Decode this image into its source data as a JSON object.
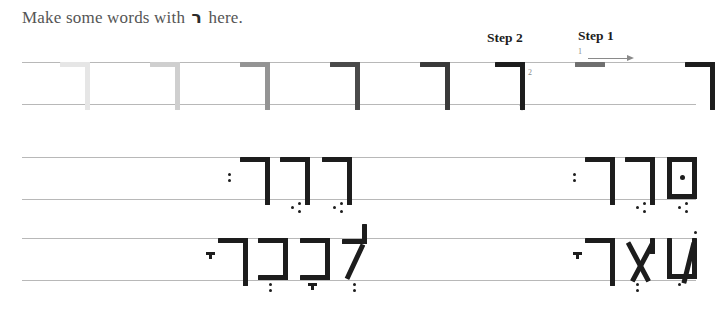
{
  "page": {
    "heading_prefix": "Make some words with",
    "heading_letter": "ר",
    "heading_suffix": "here.",
    "background_color": "#ffffff",
    "rule_color": "#b8b8b8",
    "ink_color": "#1d1d1d",
    "guide_color": "#8a8a8a"
  },
  "steps": [
    {
      "id": "step1",
      "label": "Step 1",
      "number": "1",
      "direction": "right",
      "stroke": "horizontal-roof",
      "arrow_icon": "arrow-right-icon"
    },
    {
      "id": "step2",
      "label": "Step 2",
      "number": "2",
      "direction": "down",
      "stroke": "vertical-descender",
      "arrow_icon": "arrow-down-icon"
    }
  ],
  "rows": [
    {
      "id": "row1",
      "kind": "tracing-practice",
      "letters": [
        {
          "name": "resh",
          "x": 38,
          "shade": "#e6e6e6"
        },
        {
          "name": "resh",
          "x": 128,
          "shade": "#cfcfcf"
        },
        {
          "name": "resh",
          "x": 218,
          "shade": "#949494"
        },
        {
          "name": "resh",
          "x": 308,
          "shade": "#4a4a4a"
        },
        {
          "name": "resh",
          "x": 398,
          "shade": "#3a3a3a"
        },
        {
          "name": "resh",
          "x": 473,
          "shade": "#1d1d1d"
        },
        {
          "name": "resh",
          "x": 663,
          "shade": "#1d1d1d"
        }
      ],
      "demo_bar": {
        "x": 553,
        "shade": "#6f6f6f"
      }
    },
    {
      "id": "row2",
      "kind": "word-practice",
      "groups": [
        {
          "id": "row2-left-word",
          "transliteration": "resh resh resh",
          "letters": [
            {
              "name": "resh",
              "x": 300,
              "nikud": "segol"
            },
            {
              "name": "resh",
              "x": 258,
              "nikud": "segol"
            },
            {
              "name": "resh",
              "x": 218,
              "nikud": "shva",
              "nikud_side": "left"
            }
          ]
        },
        {
          "id": "row2-right-word",
          "transliteration": "final-mem resh resh",
          "letters": [
            {
              "name": "final-mem",
              "x": 645,
              "nikud": "segol",
              "dagesh": true
            },
            {
              "name": "resh",
              "x": 603,
              "nikud": "segol"
            },
            {
              "name": "resh",
              "x": 563,
              "nikud": "shva",
              "nikud_side": "left"
            }
          ]
        }
      ]
    },
    {
      "id": "row3",
      "kind": "word-practice",
      "groups": [
        {
          "id": "row3-left-word",
          "transliteration": "lamed kaf kaf resh",
          "letters": [
            {
              "name": "lamed",
              "x": 320,
              "nikud": "shva"
            },
            {
              "name": "kaf",
              "x": 278,
              "nikud": "kamatz"
            },
            {
              "name": "kaf",
              "x": 236,
              "nikud": "shva"
            },
            {
              "name": "resh",
              "x": 196,
              "nikud": "kamatz",
              "nikud_side": "left"
            }
          ]
        },
        {
          "id": "row3-right-word",
          "transliteration": "shin ayin resh",
          "letters": [
            {
              "name": "shin",
              "x": 645,
              "nikud": "holam-dot",
              "dot_above": true
            },
            {
              "name": "ayin",
              "x": 603,
              "nikud": "shva"
            },
            {
              "name": "resh",
              "x": 563,
              "nikud": "kamatz",
              "nikud_side": "left"
            }
          ]
        }
      ]
    }
  ]
}
